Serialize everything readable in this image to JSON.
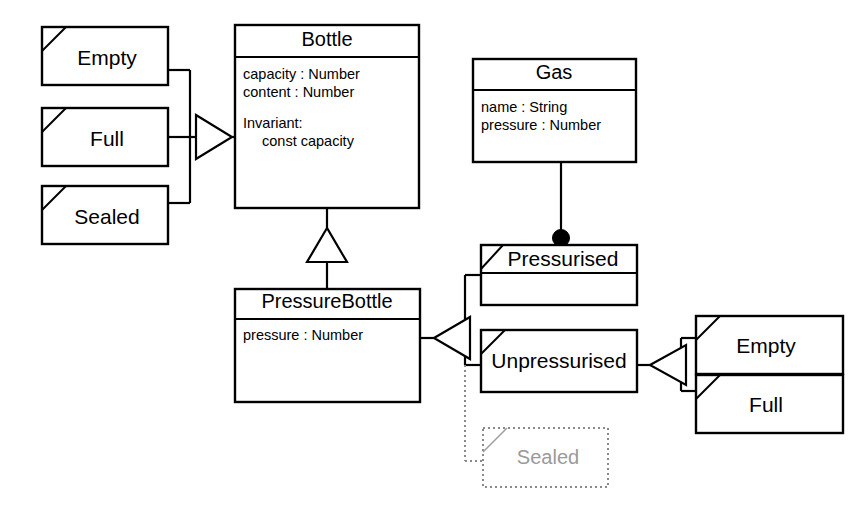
{
  "diagram": {
    "type": "uml-class-diagram",
    "background_color": "#ffffff",
    "line_color": "#000000",
    "ghost_color": "#9a9a9a"
  },
  "classes": {
    "bottle": {
      "name": "Bottle",
      "attributes": [
        "capacity : Number",
        "content : Number"
      ],
      "invariant_label": "Invariant:",
      "invariant_body": "const capacity"
    },
    "gas": {
      "name": "Gas",
      "attributes": [
        "name : String",
        "pressure : Number"
      ]
    },
    "pressure_bottle": {
      "name": "PressureBottle",
      "attributes": [
        "pressure : Number"
      ]
    }
  },
  "bottle_states": [
    {
      "id": "empty",
      "label": "Empty"
    },
    {
      "id": "full",
      "label": "Full"
    },
    {
      "id": "sealed",
      "label": "Sealed"
    }
  ],
  "pressure_states": [
    {
      "id": "pressurised",
      "label": "Pressurised"
    },
    {
      "id": "unpressurised",
      "label": "Unpressurised"
    }
  ],
  "unpressurised_states": [
    {
      "id": "empty2",
      "label": "Empty"
    },
    {
      "id": "full2",
      "label": "Full"
    }
  ],
  "ghost_state": {
    "id": "sealed-ghost",
    "label": "Sealed",
    "style": "dotted-greyed-out"
  },
  "relations": [
    {
      "id": "bottle-states-generalization",
      "kind": "generalization",
      "from": [
        "Empty",
        "Full",
        "Sealed"
      ],
      "to": "Bottle",
      "arrow": "hollow-triangle"
    },
    {
      "id": "bottle-pressurebottle-generalization",
      "kind": "generalization",
      "from": "PressureBottle",
      "to": "Bottle",
      "arrow": "hollow-triangle"
    },
    {
      "id": "gas-pressurised-composition",
      "kind": "composition",
      "from": "Gas",
      "to": "Pressurised",
      "arrow": "filled-circle"
    },
    {
      "id": "pressurebottle-states-generalization",
      "kind": "generalization",
      "from": [
        "Pressurised",
        "Unpressurised",
        "Sealed"
      ],
      "to": "PressureBottle",
      "arrow": "hollow-triangle"
    },
    {
      "id": "unpressurised-states-generalization",
      "kind": "generalization",
      "from": [
        "Empty",
        "Full"
      ],
      "to": "Unpressurised",
      "arrow": "hollow-triangle"
    }
  ]
}
